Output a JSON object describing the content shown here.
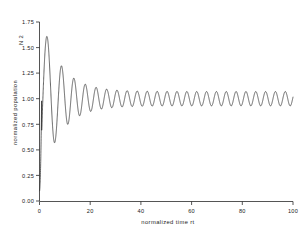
{
  "chart_data": {
    "type": "line",
    "title": "",
    "xlabel": "normalized   time        rt",
    "ylabel": "normalized   population",
    "series_marker": "N 2",
    "xlim": [
      0,
      100
    ],
    "ylim": [
      0.0,
      1.75
    ],
    "grid": false,
    "legend_position": "none",
    "x_ticks": [
      0,
      20,
      40,
      60,
      80,
      100
    ],
    "x_tick_labels": [
      "0",
      "20",
      "40",
      "60",
      "80",
      "100"
    ],
    "y_ticks": [
      0.0,
      0.25,
      0.5,
      0.75,
      1.0,
      1.25,
      1.5,
      1.75
    ],
    "y_tick_labels": [
      "0.00",
      "0.25",
      "0.50",
      "0.75",
      "1.00",
      "1.25",
      "1.50",
      "1.75"
    ],
    "line_color": "#303030",
    "background_color": "#ffffff",
    "axis_color": "#2a2a2a",
    "x": [
      0.0,
      0.3,
      0.6,
      0.9,
      1.2,
      1.5,
      1.8,
      2.1,
      2.4,
      2.7,
      3.0,
      3.3,
      3.6,
      3.9,
      4.2,
      4.5,
      4.8,
      5.1,
      5.4,
      5.7,
      6.0,
      6.3,
      6.6,
      6.9,
      7.2,
      7.5,
      7.8,
      8.1,
      8.4,
      8.7,
      9.0,
      9.3,
      9.6,
      9.9,
      10.2,
      10.5,
      10.8,
      11.1,
      11.4,
      11.7,
      12.0,
      12.3,
      12.6,
      12.9,
      13.2,
      13.5,
      13.8,
      14.1,
      14.4,
      14.7,
      15.0,
      15.3,
      15.6,
      15.9,
      16.2,
      16.5,
      16.8,
      17.1,
      17.4,
      17.7,
      18.0,
      18.3,
      18.6,
      18.9,
      19.2,
      19.5,
      19.8,
      20.1,
      20.4,
      20.7,
      21.0,
      21.3,
      21.6,
      21.9,
      22.2,
      22.5,
      22.8,
      23.1,
      23.4,
      23.7,
      24.0,
      24.3,
      24.6,
      24.9,
      25.2,
      25.5,
      25.8,
      26.1,
      26.4,
      26.7,
      27.0,
      27.3,
      27.6,
      27.9,
      28.2,
      28.5,
      28.8,
      29.1,
      29.4,
      29.7,
      30.0
    ],
    "y_first_peaks": [
      1.65,
      1.25,
      1.32,
      1.3,
      1.21
    ],
    "y_first_troughs": [
      0.6,
      0.67,
      0.74,
      0.81,
      0.85
    ],
    "asymptote": 1.0,
    "final_amplitude": 0.07
  }
}
